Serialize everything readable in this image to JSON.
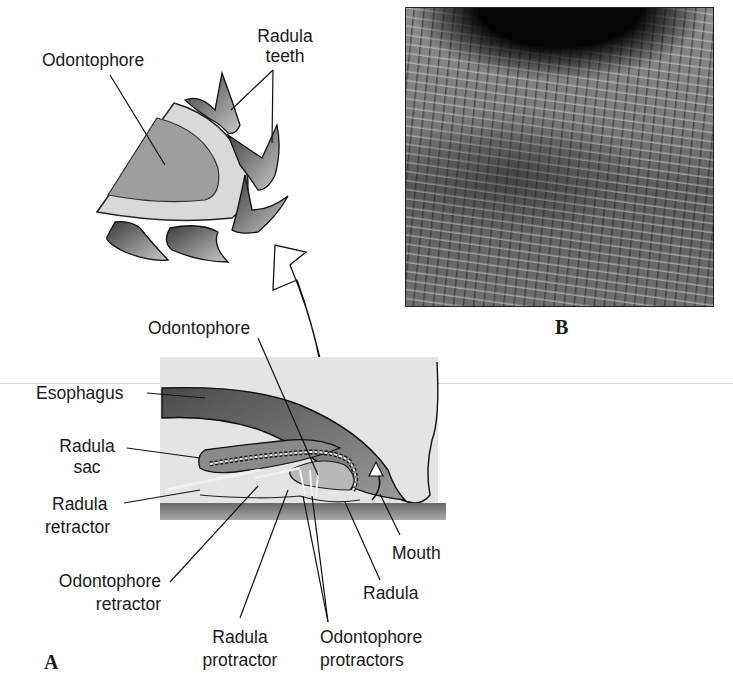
{
  "figure": {
    "panel_a_letter": "A",
    "panel_b_letter": "B",
    "inset_labels": {
      "odontophore": "Odontophore",
      "radula_teeth_line1": "Radula",
      "radula_teeth_line2": "teeth"
    },
    "labels": {
      "odontophore": "Odontophore",
      "esophagus": "Esophagus",
      "radula_sac_line1": "Radula",
      "radula_sac_line2": "sac",
      "radula_retractor_line1": "Radula",
      "radula_retractor_line2": "retractor",
      "odontophore_retractor_line1": "Odontophore",
      "odontophore_retractor_line2": "retractor",
      "radula_protractor_line1": "Radula",
      "radula_protractor_line2": "protractor",
      "odontophore_protractors_line1": "Odontophore",
      "odontophore_protractors_line2": "protractors",
      "radula": "Radula",
      "mouth": "Mouth"
    },
    "photo": {
      "description": "Micrograph of radula teeth rows"
    }
  }
}
